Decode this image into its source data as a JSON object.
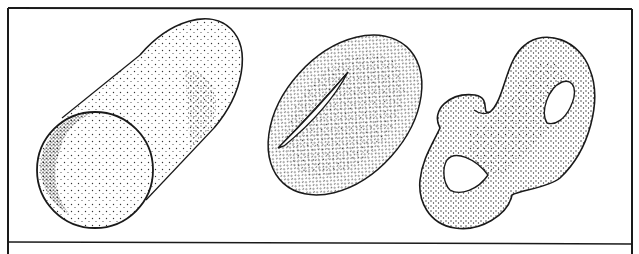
{
  "figure": {
    "panels": [
      {
        "name": "cylinder",
        "label": "Cylinder"
      },
      {
        "name": "torus",
        "label": "Torus (genus 1)"
      },
      {
        "name": "double-torus",
        "label": "Double torus (genus 2)"
      }
    ],
    "colors": {
      "ink": "#1a1a1a",
      "paper": "#ffffff",
      "stipple": "#2a2a2a"
    }
  }
}
